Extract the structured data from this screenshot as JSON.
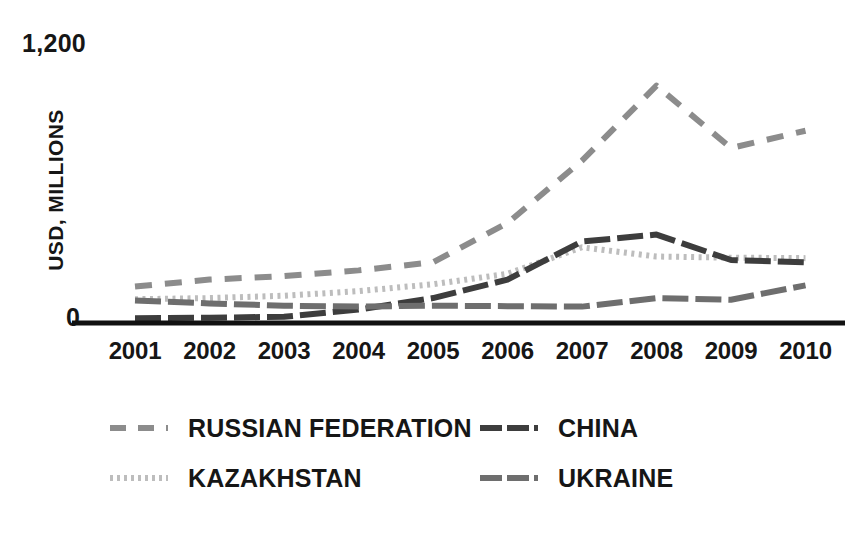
{
  "chart": {
    "type": "line",
    "y_axis_title": "USD, MILLIONS",
    "y_tick_top": "1,200",
    "y_tick_zero": "0"
  },
  "chart_data": {
    "type": "line",
    "title": "",
    "subtitle": "",
    "xlabel": "",
    "ylabel": "USD, MILLIONS",
    "categories": [
      "2001",
      "2002",
      "2003",
      "2004",
      "2005",
      "2006",
      "2007",
      "2008",
      "2009",
      "2010"
    ],
    "ylim": [
      0,
      1200
    ],
    "yticks": [
      0,
      1200
    ],
    "ytick_labels": [
      "0",
      "1,200"
    ],
    "grid": false,
    "legend_position": "bottom",
    "series": [
      {
        "name": "RUSSIAN FEDERATION",
        "color": "#8c8c8c",
        "line_style": "dashed",
        "values": [
          145,
          175,
          190,
          215,
          250,
          420,
          690,
          1015,
          745,
          820
        ]
      },
      {
        "name": "KAZAKHSTAN",
        "color": "#bdbdbd",
        "line_style": "dotted",
        "values": [
          90,
          95,
          105,
          125,
          155,
          200,
          315,
          275,
          270,
          268
        ]
      },
      {
        "name": "CHINA",
        "color": "#3d3d3d",
        "line_style": "dash-dot",
        "values": [
          8,
          10,
          14,
          45,
          95,
          175,
          340,
          370,
          260,
          250
        ]
      },
      {
        "name": "UKRAINE",
        "color": "#6e6e6e",
        "line_style": "dash-dot",
        "values": [
          85,
          72,
          62,
          58,
          62,
          60,
          58,
          95,
          88,
          150
        ]
      }
    ]
  },
  "legend": {
    "entries": [
      {
        "id": "russian-federation",
        "label": "RUSSIAN FEDERATION"
      },
      {
        "id": "china",
        "label": "CHINA"
      },
      {
        "id": "kazakhstan",
        "label": "KAZAKHSTAN"
      },
      {
        "id": "ukraine",
        "label": "UKRAINE"
      }
    ]
  }
}
